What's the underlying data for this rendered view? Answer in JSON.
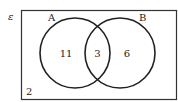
{
  "diagram": {
    "type": "venn",
    "universal_symbol": "ε",
    "sets": [
      {
        "name": "A",
        "label": "A"
      },
      {
        "name": "B",
        "label": "B"
      }
    ],
    "regions": {
      "a_only": "11",
      "a_and_b": "3",
      "b_only": "6",
      "outside": "2"
    }
  },
  "colors": {
    "stroke": "#222222",
    "box": "#333333",
    "background": "#ffffff"
  }
}
